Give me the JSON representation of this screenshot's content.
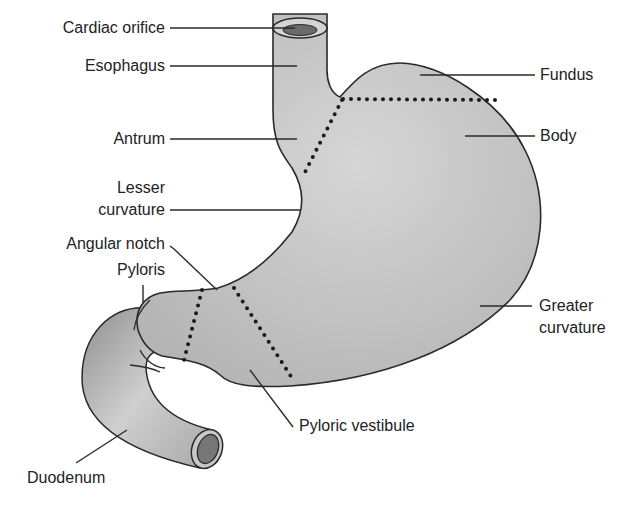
{
  "diagram": {
    "colors": {
      "fill": "#c8c8c8",
      "fill_dark": "#9a9a9a",
      "outline": "#2a2a2a",
      "dots": "#1a1a1a",
      "text": "#222222",
      "background": "#ffffff"
    },
    "labels": {
      "cardiac_orifice": "Cardiac orifice",
      "esophagus": "Esophagus",
      "antrum": "Antrum",
      "lesser_curvature_1": "Lesser",
      "lesser_curvature_2": "curvature",
      "angular_notch": "Angular notch",
      "pyloris": "Pyloris",
      "duodenum": "Duodenum",
      "fundus": "Fundus",
      "body": "Body",
      "greater_curvature_1": "Greater",
      "greater_curvature_2": "curvature",
      "pyloric_vestibule": "Pyloric vestibule"
    }
  }
}
